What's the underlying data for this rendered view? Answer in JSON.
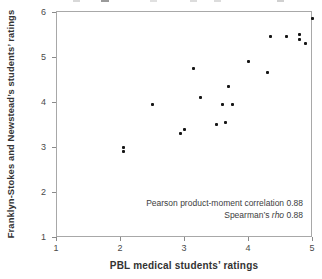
{
  "figure": {
    "annotation": {
      "pearson": "Pearson product-moment correlation 0.88",
      "spearman_prefix": "Spearman’s ",
      "spearman_italic": "rho",
      "spearman_suffix": " 0.88"
    }
  },
  "chart_data": {
    "type": "scatter",
    "title": "",
    "xlabel": "PBL medical students’ ratings",
    "ylabel": "Franklyn-Stokes and Newstead’s students’ ratings",
    "xlim": [
      1,
      5
    ],
    "ylim": [
      1,
      6
    ],
    "x_ticks": [
      1,
      2,
      3,
      4,
      5
    ],
    "y_ticks": [
      1,
      2,
      3,
      4,
      5,
      6
    ],
    "grid": false,
    "legend": "none",
    "marker": {
      "shape": "square",
      "size_px": 3,
      "color": "#161616"
    },
    "annotations": [
      "Pearson product-moment correlation 0.88",
      "Spearman's rho 0.88"
    ],
    "points": [
      [
        2.05,
        3.0
      ],
      [
        2.05,
        2.9
      ],
      [
        2.5,
        3.95
      ],
      [
        2.95,
        3.3
      ],
      [
        3.0,
        3.4
      ],
      [
        3.15,
        4.75
      ],
      [
        3.25,
        4.1
      ],
      [
        3.5,
        3.5
      ],
      [
        3.65,
        3.55
      ],
      [
        3.6,
        3.95
      ],
      [
        3.75,
        3.95
      ],
      [
        3.7,
        4.35
      ],
      [
        4.0,
        4.9
      ],
      [
        4.3,
        4.65
      ],
      [
        4.35,
        5.45
      ],
      [
        4.6,
        5.45
      ],
      [
        4.8,
        5.5
      ],
      [
        4.8,
        5.4
      ],
      [
        4.9,
        5.3
      ],
      [
        5.0,
        5.85
      ]
    ]
  },
  "colors": {
    "background": "#ffffff",
    "plot_border": "#a8a8a8",
    "tick": "#8a8a8a",
    "tick_label": "#4a4a4a",
    "axis_title": "#333333",
    "annotation_text": "#3d3d3d",
    "point": "#161616"
  },
  "crop_artifacts": [
    {
      "x": 73,
      "w": 7,
      "color": "#d8d8d8"
    },
    {
      "x": 101,
      "w": 8,
      "color": "#9a9a9a"
    },
    {
      "x": 150,
      "w": 7,
      "color": "#e0e0e0"
    },
    {
      "x": 190,
      "w": 7,
      "color": "#dcdcdc"
    },
    {
      "x": 214,
      "w": 7,
      "color": "#dcdcdc"
    },
    {
      "x": 277,
      "w": 7,
      "color": "#d0d0d0"
    }
  ]
}
